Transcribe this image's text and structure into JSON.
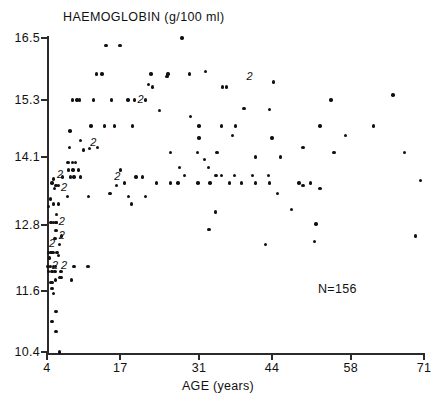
{
  "chart_data": {
    "type": "scatter",
    "title": "HAEMOGLOBIN  (g/100 ml)",
    "xlabel": "AGE (years)",
    "ylabel": "HAEMOGLOBIN (g/100 ml)",
    "annotation": "N=156",
    "grid": false,
    "legend": null,
    "xlim": [
      4,
      71
    ],
    "ylim": [
      10.4,
      16.5
    ],
    "xticks": [
      4,
      17,
      31,
      44,
      58,
      71
    ],
    "xtick_labels": [
      "4",
      "17",
      "31",
      "44",
      "58",
      "71"
    ],
    "yticks": [
      10.4,
      11.6,
      12.8,
      14.1,
      15.3,
      16.5
    ],
    "ytick_labels": [
      "10.4",
      "11.6",
      "12.8",
      "14.1",
      "15.3",
      "16.5"
    ],
    "n_total": 156,
    "duplicate_marker_label": "2",
    "points": [
      [
        6.2,
        10.4
      ],
      [
        5.6,
        10.8
      ],
      [
        4.9,
        11.0
      ],
      [
        5.6,
        11.2
      ],
      [
        5.2,
        11.55
      ],
      [
        4.9,
        11.65
      ],
      [
        4.7,
        11.75
      ],
      [
        5.0,
        11.75
      ],
      [
        5.5,
        11.8
      ],
      [
        8.3,
        11.8
      ],
      [
        6.3,
        11.85
      ],
      [
        6.6,
        11.85
      ],
      [
        4.3,
        11.95
      ],
      [
        4.9,
        11.95
      ],
      [
        5.4,
        11.95
      ],
      [
        6.4,
        11.95
      ],
      [
        6.6,
        11.95
      ],
      [
        4.2,
        12.05
      ],
      [
        4.6,
        12.05
      ],
      [
        5.1,
        12.05
      ],
      [
        5.5,
        12.05
      ],
      [
        8.8,
        12.05
      ],
      [
        11.3,
        12.05
      ],
      [
        4.4,
        12.2
      ],
      [
        6.0,
        12.25
      ],
      [
        4.3,
        12.3
      ],
      [
        4.7,
        12.3
      ],
      [
        4.9,
        12.3
      ],
      [
        5.1,
        12.3
      ],
      [
        5.8,
        12.3
      ],
      [
        6.2,
        12.45
      ],
      [
        5.4,
        12.55
      ],
      [
        6.6,
        12.6
      ],
      [
        5.6,
        12.7
      ],
      [
        32.8,
        12.72
      ],
      [
        42.8,
        12.45
      ],
      [
        51.5,
        12.5
      ],
      [
        69.5,
        12.6
      ],
      [
        5.6,
        12.85
      ],
      [
        5.7,
        12.85
      ],
      [
        4.7,
        12.85
      ],
      [
        5.2,
        12.85
      ],
      [
        51.8,
        12.82
      ],
      [
        5.7,
        13.0
      ],
      [
        33.9,
        13.05
      ],
      [
        47.5,
        13.1
      ],
      [
        4.3,
        13.15
      ],
      [
        5.1,
        13.2
      ],
      [
        6.0,
        13.2
      ],
      [
        4.6,
        13.3
      ],
      [
        19.0,
        13.2
      ],
      [
        7.6,
        13.35
      ],
      [
        11.4,
        13.35
      ],
      [
        15.2,
        13.4
      ],
      [
        18.5,
        13.35
      ],
      [
        21.5,
        13.35
      ],
      [
        45.0,
        13.4
      ],
      [
        49.5,
        13.55
      ],
      [
        52.5,
        13.5
      ],
      [
        5.3,
        13.5
      ],
      [
        5.6,
        13.55
      ],
      [
        6.0,
        13.55
      ],
      [
        4.9,
        13.6
      ],
      [
        5.1,
        13.68
      ],
      [
        16.4,
        13.55
      ],
      [
        17.8,
        13.6
      ],
      [
        23.5,
        13.6
      ],
      [
        26.0,
        13.6
      ],
      [
        27.3,
        13.6
      ],
      [
        30.8,
        13.6
      ],
      [
        33.0,
        13.6
      ],
      [
        36.4,
        13.6
      ],
      [
        38.6,
        13.6
      ],
      [
        41.0,
        13.6
      ],
      [
        43.5,
        13.6
      ],
      [
        48.8,
        13.6
      ],
      [
        50.8,
        13.6
      ],
      [
        70.4,
        13.65
      ],
      [
        6.8,
        13.72
      ],
      [
        8.2,
        13.72
      ],
      [
        8.8,
        13.72
      ],
      [
        10.0,
        13.72
      ],
      [
        19.8,
        13.72
      ],
      [
        21.0,
        13.72
      ],
      [
        28.4,
        13.75
      ],
      [
        34.0,
        13.75
      ],
      [
        35.0,
        13.75
      ],
      [
        37.3,
        13.75
      ],
      [
        40.5,
        13.75
      ],
      [
        43.4,
        13.75
      ],
      [
        7.8,
        13.85
      ],
      [
        8.6,
        13.85
      ],
      [
        9.6,
        13.85
      ],
      [
        17.1,
        13.85
      ],
      [
        27.5,
        13.9
      ],
      [
        32.7,
        13.9
      ],
      [
        7.7,
        14.0
      ],
      [
        8.5,
        14.0
      ],
      [
        9.1,
        14.0
      ],
      [
        32.0,
        14.05
      ],
      [
        26.0,
        14.2
      ],
      [
        30.7,
        14.2
      ],
      [
        34.2,
        14.2
      ],
      [
        41.0,
        14.1
      ],
      [
        45.5,
        14.1
      ],
      [
        67.5,
        14.2
      ],
      [
        55.0,
        14.2
      ],
      [
        49.5,
        14.3
      ],
      [
        8.0,
        14.3
      ],
      [
        10.5,
        14.25
      ],
      [
        11.6,
        14.28
      ],
      [
        13.0,
        14.3
      ],
      [
        10.0,
        14.45
      ],
      [
        31.0,
        14.5
      ],
      [
        37.0,
        14.55
      ],
      [
        44.0,
        14.5
      ],
      [
        57.0,
        14.55
      ],
      [
        8.1,
        14.65
      ],
      [
        11.8,
        14.75
      ],
      [
        14.2,
        14.75
      ],
      [
        16.0,
        14.75
      ],
      [
        19.2,
        14.75
      ],
      [
        31.0,
        14.75
      ],
      [
        35.0,
        14.75
      ],
      [
        37.5,
        14.75
      ],
      [
        52.5,
        14.75
      ],
      [
        62.0,
        14.75
      ],
      [
        29.5,
        14.95
      ],
      [
        24.0,
        15.08
      ],
      [
        39.0,
        15.12
      ],
      [
        43.5,
        15.1
      ],
      [
        8.5,
        15.3
      ],
      [
        9.3,
        15.3
      ],
      [
        9.8,
        15.3
      ],
      [
        12.3,
        15.3
      ],
      [
        15.5,
        15.3
      ],
      [
        18.4,
        15.3
      ],
      [
        19.6,
        15.3
      ],
      [
        21.5,
        15.3
      ],
      [
        54.5,
        15.3
      ],
      [
        65.5,
        15.4
      ],
      [
        22.8,
        15.55
      ],
      [
        35.2,
        15.55
      ],
      [
        35.9,
        15.55
      ],
      [
        22.0,
        15.6
      ],
      [
        25.3,
        15.75
      ],
      [
        44.2,
        15.65
      ],
      [
        12.8,
        15.8
      ],
      [
        13.8,
        15.8
      ],
      [
        22.5,
        15.8
      ],
      [
        25.5,
        15.8
      ],
      [
        29.3,
        15.8
      ],
      [
        32.2,
        15.85
      ],
      [
        14.5,
        16.35
      ],
      [
        17.0,
        16.35
      ],
      [
        28.0,
        16.5
      ]
    ],
    "duplicate_markers": [
      [
        6.3,
        13.75
      ],
      [
        7.0,
        13.5
      ],
      [
        6.6,
        12.85
      ],
      [
        6.6,
        12.6
      ],
      [
        4.9,
        12.45
      ],
      [
        5.4,
        12.05
      ],
      [
        7.0,
        12.05
      ],
      [
        12.2,
        14.4
      ],
      [
        16.5,
        13.72
      ],
      [
        20.6,
        15.3
      ],
      [
        40.0,
        15.75
      ]
    ]
  }
}
